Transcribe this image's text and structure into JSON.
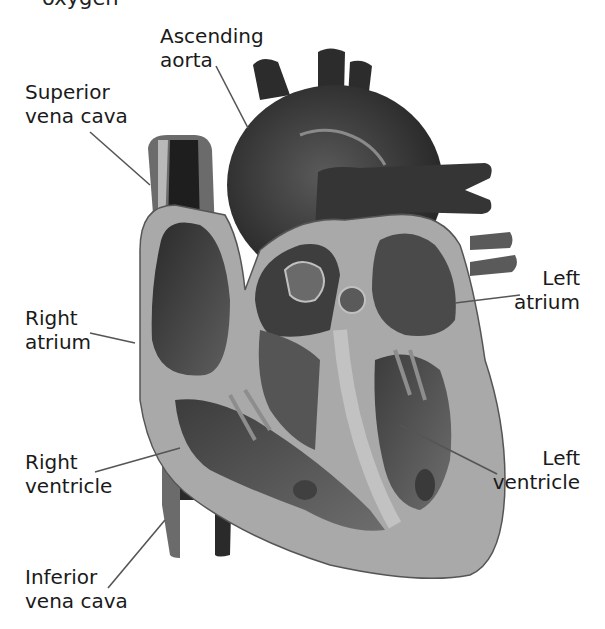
{
  "figure": {
    "top_cutoff_text": "oxygen",
    "colors": {
      "background": "#ffffff",
      "text": "#1a1a1a",
      "leader_line": "#555555",
      "heart_wall": "#a9a9a9",
      "chamber_dark": "#3a3a3a",
      "vessel_dark": "#2e2e2e",
      "highlight": "#c8c8c8"
    },
    "labels": {
      "ascending_aorta": {
        "line1": "Ascending",
        "line2": "aorta"
      },
      "superior_vena_cava": {
        "line1": "Superior",
        "line2": "vena cava"
      },
      "right_atrium": {
        "line1": "Right",
        "line2": "atrium"
      },
      "right_ventricle": {
        "line1": "Right",
        "line2": "ventricle"
      },
      "inferior_vena_cava": {
        "line1": "Inferior",
        "line2": "vena cava"
      },
      "left_atrium": {
        "line1": "Left",
        "line2": "atrium"
      },
      "left_ventricle": {
        "line1": "Left",
        "line2": "ventricle"
      }
    }
  }
}
